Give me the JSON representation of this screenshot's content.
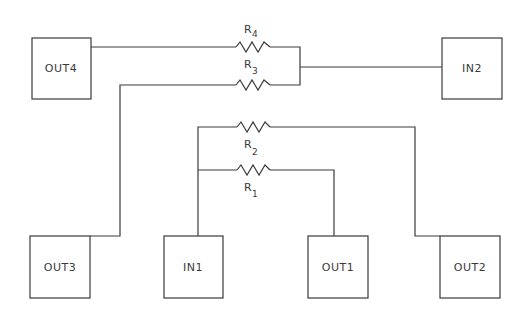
{
  "diagram": {
    "type": "circuit-schematic",
    "colors": {
      "stroke": "#3a3a3a",
      "background": "#ffffff"
    },
    "nodes": [
      {
        "id": "out4",
        "label": "OUT4"
      },
      {
        "id": "in2",
        "label": "IN2"
      },
      {
        "id": "out3",
        "label": "OUT3"
      },
      {
        "id": "in1",
        "label": "IN1"
      },
      {
        "id": "out1",
        "label": "OUT1"
      },
      {
        "id": "out2",
        "label": "OUT2"
      }
    ],
    "resistors": [
      {
        "id": "r4",
        "letter": "R",
        "index": "4",
        "from": "OUT4",
        "to": "IN2"
      },
      {
        "id": "r3",
        "letter": "R",
        "index": "3",
        "from": "OUT3",
        "to": "IN2"
      },
      {
        "id": "r2",
        "letter": "R",
        "index": "2",
        "from": "IN1",
        "to": "OUT2"
      },
      {
        "id": "r1",
        "letter": "R",
        "index": "1",
        "from": "IN1",
        "to": "OUT1"
      }
    ]
  }
}
